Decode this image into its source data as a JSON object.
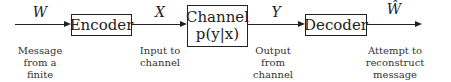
{
  "blocks": {
    "encoder": {
      "label": "Encoder"
    },
    "channel": {
      "label": "Channel",
      "formula": "p(y|x)"
    },
    "decoder": {
      "label": "Decoder"
    }
  },
  "signals": {
    "W": "W",
    "X": "X",
    "Y": "Y",
    "W_hat": "Ŵ"
  },
  "captions": {
    "message": [
      "Message",
      "from a finite",
      "alphabet"
    ],
    "input": [
      "Input to",
      "channel"
    ],
    "output": [
      "Output from",
      "channel"
    ],
    "attempt": [
      "Attempt to",
      "reconstruct message",
      "based on output"
    ]
  }
}
